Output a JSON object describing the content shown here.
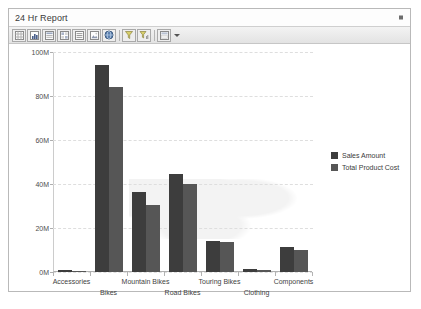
{
  "window": {
    "title": "24 Hr Report",
    "collapse_icon": "collapse-square-icon"
  },
  "toolbar": {
    "buttons": [
      {
        "name": "grid-view-icon",
        "label": ""
      },
      {
        "name": "bar-chart-icon",
        "label": ""
      },
      {
        "name": "table-report-icon",
        "label": ""
      },
      {
        "name": "matrix-icon",
        "label": ""
      },
      {
        "name": "list-icon",
        "label": ""
      },
      {
        "name": "image-icon",
        "label": ""
      },
      {
        "name": "globe-icon",
        "label": ""
      },
      {
        "name": "filter-icon",
        "label": ""
      },
      {
        "name": "filter-sort-icon",
        "label": ""
      },
      {
        "name": "layout-icon",
        "label": ""
      }
    ],
    "dropdown_caret": "chevron-down-icon"
  },
  "chart_data": {
    "type": "bar",
    "title": "",
    "xlabel": "",
    "ylabel": "",
    "ylim": [
      0,
      100000000
    ],
    "yticks": [
      0,
      20000000,
      40000000,
      60000000,
      80000000,
      100000000
    ],
    "ytick_labels": [
      "0M",
      "20M",
      "40M",
      "60M",
      "80M",
      "100M"
    ],
    "grid": true,
    "legend_position": "right",
    "categories": [
      "Accessories",
      "Bikes",
      "Mountain Bikes",
      "Road Bikes",
      "Touring Bikes",
      "Clothing",
      "Components"
    ],
    "series": [
      {
        "name": "Sales Amount",
        "color": "#3d3d3d",
        "values": [
          1000000,
          94000000,
          36500000,
          44500000,
          14000000,
          1200000,
          11200000
        ]
      },
      {
        "name": "Total Product Cost",
        "color": "#565656",
        "values": [
          600000,
          84000000,
          30500000,
          40000000,
          13500000,
          900000,
          10000000
        ]
      }
    ]
  }
}
